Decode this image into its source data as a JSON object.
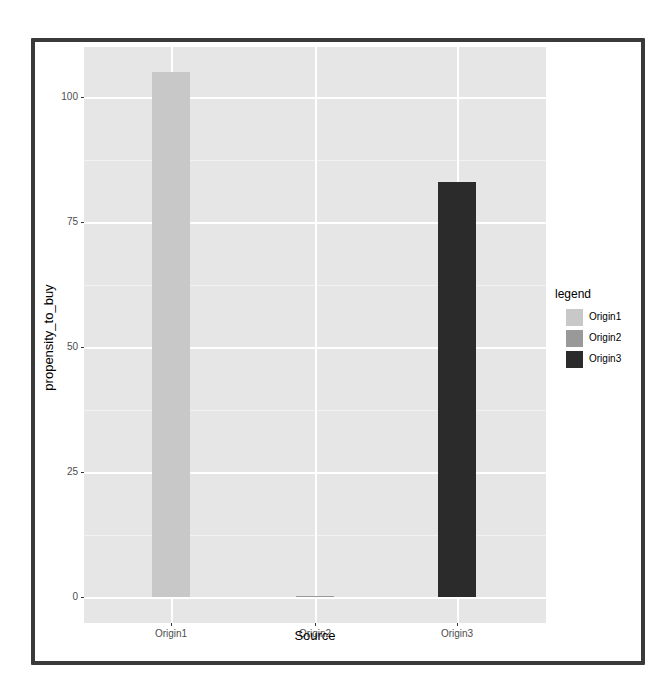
{
  "chart_data": {
    "type": "bar",
    "title": "",
    "xlabel": "Source",
    "ylabel": "propensity_to_buy",
    "categories": [
      "Origin1",
      "Origin2",
      "Origin3"
    ],
    "values": [
      105,
      0,
      83
    ],
    "colors": [
      "#c8c8c8",
      "#999999",
      "#2b2b2b"
    ],
    "ylim": [
      -5,
      110
    ],
    "yticks": [
      0,
      25,
      50,
      75,
      100
    ],
    "ytick_labels": [
      "0",
      "25",
      "50",
      "75",
      "100"
    ],
    "grid": true,
    "legend": {
      "title": "legend",
      "position": "right",
      "entries": [
        "Origin1",
        "Origin2",
        "Origin3"
      ]
    }
  }
}
